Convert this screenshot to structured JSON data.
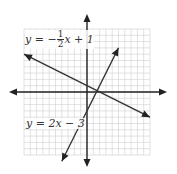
{
  "diagram": {
    "title": "",
    "grid": {
      "xmin": -10,
      "xmax": 10,
      "ymin": -10,
      "ymax": 10,
      "step": 1
    },
    "axes": {
      "x_arrows": true,
      "y_arrows": true
    },
    "colors": {
      "grid": "#cfcfcf",
      "axis": "#222222",
      "line": "#333333",
      "background": "#ffffff"
    },
    "lines": [
      {
        "name": "line-1",
        "equation": "y = -1/2 x + 1",
        "slope": -0.5,
        "intercept": 1,
        "x_from": -10,
        "x_to": 10
      },
      {
        "name": "line-2",
        "equation": "y = 2x - 3",
        "slope": 2,
        "intercept": -3,
        "x_from": -4,
        "x_to": 5
      }
    ],
    "labels": {
      "line1": {
        "prefix": "y = −",
        "numerator": "1",
        "denominator": "2",
        "suffix": "x + 1"
      },
      "line2": {
        "text": "y = 2x − 3"
      }
    }
  }
}
